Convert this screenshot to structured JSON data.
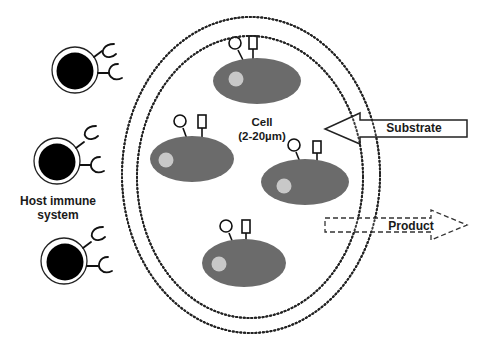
{
  "diagram": {
    "labels": {
      "host_immune_system_line1": "Host immune",
      "host_immune_system_line2": "system",
      "cell_line1": "Cell",
      "cell_line2": "(2-20µm)",
      "substrate": "Substrate",
      "product": "Product"
    },
    "colors": {
      "cell_fill": "#6b6b6b",
      "nucleus_fill": "#c8c8c8",
      "immune_core": "#000000",
      "line": "#1a1a1a",
      "background": "#ffffff"
    },
    "nodes": {
      "immune_cells": [
        "immune-cell-top",
        "immune-cell-middle",
        "immune-cell-bottom"
      ],
      "encapsulated_cells": [
        "cell-top",
        "cell-left",
        "cell-right",
        "cell-bottom"
      ],
      "capsule_membranes": [
        "outer-membrane",
        "inner-membrane"
      ]
    },
    "edges": [
      {
        "from": "substrate",
        "to": "capsule",
        "style": "solid-arrow"
      },
      {
        "from": "capsule",
        "to": "product",
        "style": "dashed-arrow"
      }
    ]
  }
}
